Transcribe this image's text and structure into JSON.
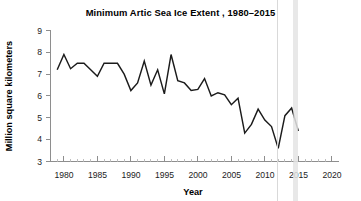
{
  "chart_data": {
    "type": "line",
    "title": "Minimum Artic Sea Ice Extent , 1980–2015",
    "xlabel": "Year",
    "ylabel": "Million square kilometers",
    "xlim": [
      1978,
      2021
    ],
    "ylim": [
      3,
      9
    ],
    "grid": false,
    "legend": "none",
    "x_major_ticks": [
      1980,
      1985,
      1990,
      1995,
      2000,
      2005,
      2010,
      2015,
      2020
    ],
    "x_major_tick_labels": [
      "1980",
      "1985",
      "1990",
      "1995",
      "2000",
      "2005",
      "2010",
      "2015",
      "2020"
    ],
    "x_minor_tick_step": 1,
    "y_ticks": [
      3,
      4,
      5,
      6,
      7,
      8,
      9
    ],
    "y_tick_labels": [
      "3",
      "4",
      "5",
      "6",
      "7",
      "8",
      "9"
    ],
    "series": [
      {
        "name": "Minimum Arctic sea ice extent",
        "color": "#1b1b1b",
        "x": [
          1979,
          1980,
          1981,
          1982,
          1983,
          1984,
          1985,
          1986,
          1987,
          1988,
          1989,
          1990,
          1991,
          1992,
          1993,
          1994,
          1995,
          1996,
          1997,
          1998,
          1999,
          2000,
          2001,
          2002,
          2003,
          2004,
          2005,
          2006,
          2007,
          2008,
          2009,
          2010,
          2011,
          2012,
          2013,
          2014,
          2015
        ],
        "values": [
          7.2,
          7.9,
          7.25,
          7.5,
          7.5,
          7.2,
          6.9,
          7.5,
          7.5,
          7.5,
          7.0,
          6.25,
          6.6,
          7.6,
          6.5,
          7.2,
          6.1,
          7.9,
          6.7,
          6.6,
          6.25,
          6.3,
          6.8,
          6.0,
          6.15,
          6.05,
          5.6,
          5.9,
          4.3,
          4.7,
          5.4,
          4.9,
          4.6,
          3.6,
          5.1,
          5.45,
          4.4
        ],
        "units": "million square kilometers"
      }
    ],
    "annotations": {
      "max_value": 7.9,
      "max_years": [
        1980,
        1996
      ],
      "min_value": 3.6,
      "min_year": 2012,
      "first_value": 7.2,
      "last_value": 4.4
    },
    "colors": {
      "line": "#1b1b1b",
      "axis": "#8e8e8e",
      "text": "#1a1a1a",
      "background": "#ffffff"
    }
  },
  "artifacts": {
    "vertical_line_label": "scan-artifact-line",
    "vertical_band_label": "scan-artifact-band"
  }
}
